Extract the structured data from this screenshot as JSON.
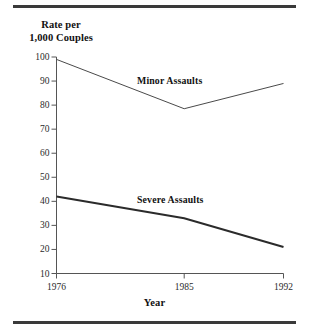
{
  "chart_data": {
    "type": "line",
    "title": "",
    "xlabel": "Year",
    "ylabel": "Rate per 1,000 Couples",
    "x": [
      1976,
      1985,
      1992
    ],
    "xtick_labels": [
      "1976",
      "1985",
      "1992"
    ],
    "ytick_labels": [
      "10",
      "20",
      "30",
      "40",
      "50",
      "60",
      "70",
      "80",
      "90",
      "100"
    ],
    "ytick_values": [
      10,
      20,
      30,
      40,
      50,
      60,
      70,
      80,
      90,
      100
    ],
    "ylim": [
      10,
      100
    ],
    "xlim": [
      1976,
      1992
    ],
    "grid": false,
    "legend_position": "inline-annotations",
    "series": [
      {
        "name": "Minor Assaults",
        "values": [
          99,
          78.5,
          89
        ],
        "color": "#4a4a4a",
        "line_width": 1
      },
      {
        "name": "Severe Assaults",
        "values": [
          42,
          33,
          21
        ],
        "color": "#2b2b2b",
        "line_width": 2
      }
    ],
    "annotations": [
      {
        "text": "Minor Assaults",
        "near_series": "Minor Assaults"
      },
      {
        "text": "Severe Assaults",
        "near_series": "Severe Assaults"
      }
    ]
  },
  "figure": {
    "y_axis_title": "Rate per\n1,000 Couples",
    "y_axis_title_line1": "Rate per",
    "y_axis_title_line2": "1,000 Couples",
    "x_axis_title": "Year",
    "rule_color": "#3a3a3a",
    "axis_color": "#555555",
    "background": "#ffffff"
  },
  "y_ticks": [
    {
      "label": "100",
      "value": 100
    },
    {
      "label": "90",
      "value": 90
    },
    {
      "label": "80",
      "value": 80
    },
    {
      "label": "70",
      "value": 70
    },
    {
      "label": "60",
      "value": 60
    },
    {
      "label": "50",
      "value": 50
    },
    {
      "label": "40",
      "value": 40
    },
    {
      "label": "30",
      "value": 30
    },
    {
      "label": "20",
      "value": 20
    },
    {
      "label": "10",
      "value": 10
    }
  ],
  "x_ticks": [
    {
      "label": "1976",
      "value": 1976
    },
    {
      "label": "1985",
      "value": 1985
    },
    {
      "label": "1992",
      "value": 1992
    }
  ]
}
